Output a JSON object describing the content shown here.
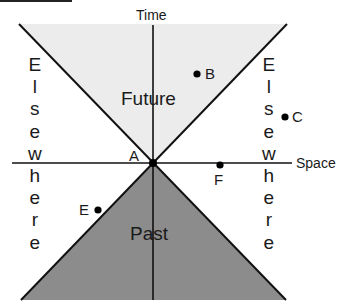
{
  "diagram": {
    "type": "spacetime light cone",
    "axes": {
      "vertical_label": "Time",
      "horizontal_label": "Space"
    },
    "regions": {
      "future": "Future",
      "past": "Past",
      "elsewhere_left": [
        "E",
        "l",
        "s",
        "e",
        "w",
        "h",
        "e",
        "r",
        "e"
      ],
      "elsewhere_right": [
        "E",
        "l",
        "s",
        "e",
        "w",
        "h",
        "e",
        "r",
        "e"
      ]
    },
    "points": {
      "A": "A",
      "B": "B",
      "C": "C",
      "E": "E",
      "F": "F"
    },
    "colors": {
      "future_fill": "#ececec",
      "past_fill": "#8c8c8c",
      "line": "#111111",
      "background": "#ffffff"
    }
  }
}
